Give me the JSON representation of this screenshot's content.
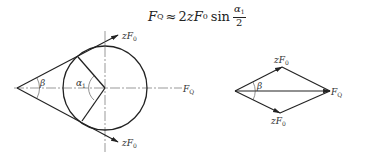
{
  "formula": {
    "lhs": "F",
    "lhs_sub": "Q",
    "approx": "≈",
    "coef": "2",
    "z": "z",
    "F": "F",
    "F_sub": "0",
    "func": "sin",
    "frac_num": "α",
    "frac_num_sub": "1",
    "frac_den": "2"
  },
  "left_figure": {
    "labels": {
      "upper_force": "zF",
      "upper_force_sub": "0",
      "lower_force": "zF",
      "lower_force_sub": "0",
      "resultant": "F",
      "resultant_sub": "Q",
      "beta": "β",
      "alpha": "α",
      "alpha_sub": "1"
    }
  },
  "right_figure": {
    "labels": {
      "upper_force": "zF",
      "upper_force_sub": "0",
      "lower_force": "zF",
      "lower_force_sub": "0",
      "resultant": "F",
      "resultant_sub": "Q",
      "beta": "β"
    }
  },
  "colors": {
    "stroke": "#222222",
    "text": "#333333"
  }
}
